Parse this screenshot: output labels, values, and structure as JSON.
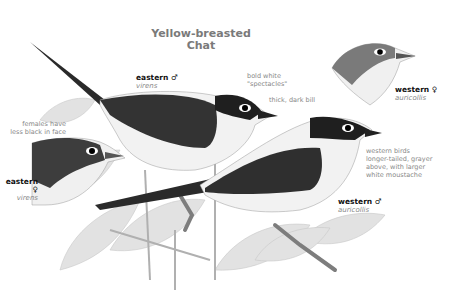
{
  "title": {
    "line1": "Yellow-breasted",
    "line2": "Chat"
  },
  "labels": {
    "eastern_male": {
      "name": "eastern ♂",
      "sci": "virens"
    },
    "eastern_female": {
      "name": "eastern ♀",
      "sci": "virens"
    },
    "western_female": {
      "name": "western ♀",
      "sci": "auricollis"
    },
    "western_male": {
      "name": "western ♂",
      "sci": "auricollis"
    }
  },
  "notes": {
    "spectacles": [
      "bold white",
      "\"spectacles\""
    ],
    "bill": [
      "thick, dark bill"
    ],
    "females": [
      "females have",
      "less black in face"
    ],
    "western": [
      "western birds",
      "longer-tailed, grayer",
      "above, with larger",
      "white moustache"
    ]
  },
  "colors": {
    "ink_dark": "#1c1c1c",
    "ink_mid": "#5a5a5a",
    "foliage": "#d8d8d8",
    "text_gray": "#888888",
    "title_gray": "#7a7a7a"
  }
}
